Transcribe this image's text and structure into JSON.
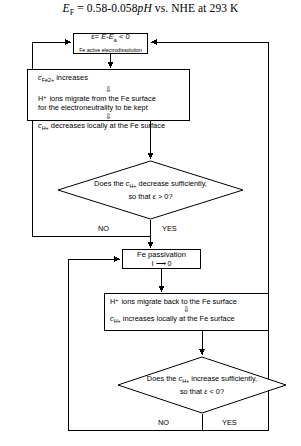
{
  "title": {
    "symbol": "E",
    "subscript": "F",
    "equation": " = 0.58-0.058",
    "ph": "pH",
    "tail": " vs. NHE at 293 K",
    "full_text": "EF = 0.58-0.058pH vs. NHE at 293 K"
  },
  "nodes": {
    "active": {
      "line1_prefix": "ε= ",
      "line1_E": "E",
      "line1_minus": "-",
      "line1_Ea": "E",
      "line1_Ea_sub": "a",
      "line1_cmp": " < 0",
      "line1_text": "ε= E-Ea < 0",
      "line2": "Fe active electrodissolution"
    },
    "process1": {
      "line1_c": "c",
      "line1_sub": "Fe2+",
      "line1_rest": " increases",
      "line1_text": "cFe2+ increases",
      "line2": "H⁺ ions migrate from the Fe surface",
      "line3": "for the electroneutrality to be kept",
      "line4_c": "c",
      "line4_sub": "H+",
      "line4_rest": " decreases locally at the Fe surface",
      "line4_text": "cH+ decreases locally at the Fe surface"
    },
    "decision1": {
      "line1_pre": "Does the ",
      "line1_c": "c",
      "line1_sub": "H+",
      "line1_post": " decrease sufficiently,",
      "line2_pre": "so that ",
      "line2_eps": "ε",
      "line2_post": " > 0?",
      "full_text": "Does the cH+ decrease sufficiently, so that ε > 0?"
    },
    "passivation": {
      "line1": "Fe passivation",
      "line2_left": "I",
      "line2_arrow": "⟶",
      "line2_right": "0",
      "line2_text": "I ⟶ 0"
    },
    "process2": {
      "line1": "H⁺ ions migrate back to the Fe surface",
      "line2_c": "c",
      "line2_sub": "H+",
      "line2_rest": " increases locally at the Fe surface",
      "line2_text": "cH+ increases locally at the Fe surface"
    },
    "decision2": {
      "line1_pre": "Does the ",
      "line1_c": "c",
      "line1_sub": "H+",
      "line1_post": " increase sufficiently,",
      "line2_pre": "so that ",
      "line2_eps": "ε",
      "line2_post": " < 0?",
      "full_text": "Does the cH+ increase sufficiently, so that ε < 0?"
    }
  },
  "branch_labels": {
    "decision1_no": "NO",
    "decision1_yes": "YES",
    "decision2_no": "NO",
    "decision2_yes": "YES"
  },
  "inner_arrows": {
    "glyph": "⇩"
  },
  "colors": {
    "stroke": "#000000",
    "background": "#ffffff",
    "text": "#000000"
  }
}
